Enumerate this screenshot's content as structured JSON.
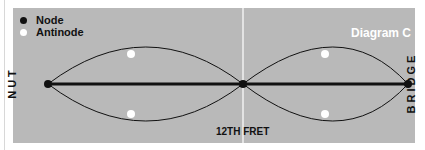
{
  "legend": {
    "items": [
      {
        "label": "Node",
        "color": "#111111"
      },
      {
        "label": "Antinode",
        "color": "#ffffff"
      }
    ]
  },
  "title": "Diagram C",
  "labels": {
    "left": "NUT",
    "right": "BRIDGE",
    "bottom": "12TH FRET"
  },
  "colors": {
    "panel": "#b9b9b9",
    "string": "#111111",
    "fret_line": "#f2f2f2"
  }
}
